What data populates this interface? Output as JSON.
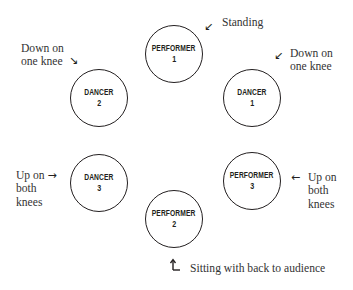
{
  "diagram": {
    "type": "stage-formation",
    "nodes": [
      {
        "id": "performer-1",
        "role": "PERFORMER",
        "number": "1",
        "cx": 175,
        "cy": 55
      },
      {
        "id": "dancer-2",
        "role": "DANCER",
        "number": "2",
        "cx": 100,
        "cy": 99
      },
      {
        "id": "dancer-1",
        "role": "DANCER",
        "number": "1",
        "cx": 253,
        "cy": 99
      },
      {
        "id": "dancer-3",
        "role": "DANCER",
        "number": "3",
        "cx": 100,
        "cy": 184
      },
      {
        "id": "performer-3",
        "role": "PERFORMER",
        "number": "3",
        "cx": 253,
        "cy": 182
      },
      {
        "id": "performer-2",
        "role": "PERFORMER",
        "number": "2",
        "cx": 175,
        "cy": 220
      }
    ],
    "annotations": {
      "performer_1": {
        "text": "Standing",
        "arrow": "↙"
      },
      "dancer_2": {
        "line1": "Down on",
        "line2": "one knee",
        "arrow": "↘"
      },
      "dancer_1": {
        "line1": "Down on",
        "line2": "one knee",
        "arrow": "↙"
      },
      "dancer_3": {
        "line1": "Up on",
        "line2": "both",
        "line3": "knees",
        "arrow": "→"
      },
      "performer_3": {
        "line1": "Up on",
        "line2": "both",
        "line3": "knees",
        "arrow": "←"
      },
      "performer_2": {
        "text": "Sitting with back to audience",
        "arrow": "↳"
      }
    },
    "colors": {
      "stroke": "#231f20",
      "label_text": "#333333",
      "background": "#ffffff"
    }
  }
}
